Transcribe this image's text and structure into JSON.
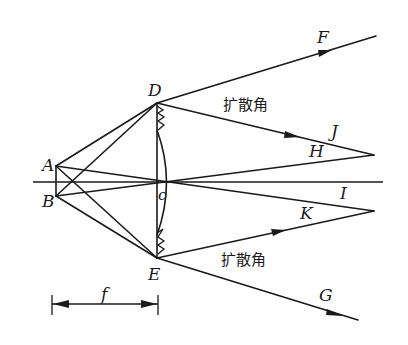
{
  "diagram": {
    "type": "optics-ray-diagram",
    "colors": {
      "ink": "#1a1a1a",
      "background": "#ffffff"
    },
    "points": {
      "A": "A",
      "B": "B",
      "D": "D",
      "E": "E",
      "c": "c",
      "F": "F",
      "G": "G",
      "H": "H",
      "I": "I",
      "J": "J",
      "K": "K"
    },
    "annotations": {
      "divergence_angle_top": "扩散角",
      "divergence_angle_bottom": "扩散角",
      "focal_length": "f"
    },
    "rays": [
      {
        "from": "A",
        "to": "D"
      },
      {
        "from": "A",
        "to": "E"
      },
      {
        "from": "B",
        "to": "D"
      },
      {
        "from": "B",
        "to": "E"
      },
      {
        "from": "A",
        "to": "c",
        "continues_to": "I"
      },
      {
        "from": "B",
        "to": "c",
        "continues_to": "H"
      },
      {
        "from": "D",
        "to": "F",
        "arrow": true
      },
      {
        "from": "D",
        "to": "J",
        "arrow": true
      },
      {
        "from": "E",
        "to": "G",
        "arrow": true
      },
      {
        "from": "E",
        "to": "K",
        "arrow": true
      }
    ]
  }
}
